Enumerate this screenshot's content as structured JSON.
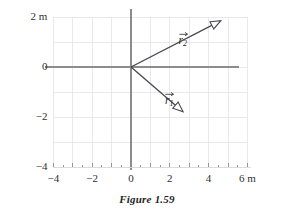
{
  "figure": {
    "caption": "Figure 1.59",
    "units_label_x": "6 m",
    "units_label_y": "2 m"
  },
  "colors": {
    "grid": "#e3e3e8",
    "axis": "#8c8c8c",
    "vector": "#4a4a50",
    "text": "#2f2f2f",
    "background": "#ffffff"
  },
  "axes": {
    "x_ticks": [
      {
        "value": -4,
        "label": "−4"
      },
      {
        "value": -2,
        "label": "−2"
      },
      {
        "value": 0,
        "label": "0"
      },
      {
        "value": 2,
        "label": "2"
      },
      {
        "value": 4,
        "label": "4"
      },
      {
        "value": 6,
        "label": "6 m"
      }
    ],
    "y_ticks": [
      {
        "value": 2,
        "label": "2 m"
      },
      {
        "value": 0,
        "label": "0"
      },
      {
        "value": -2,
        "label": "−2"
      },
      {
        "value": -4,
        "label": "−4"
      }
    ],
    "xlim": [
      -4,
      6
    ],
    "ylim": [
      -4,
      2
    ],
    "grid": true,
    "grid_step": 1
  },
  "vectors": [
    {
      "name": "r1",
      "label_base": "r",
      "label_sub": "1",
      "origin": [
        0,
        0
      ],
      "tip": [
        3,
        -2
      ],
      "label_pos": [
        1.75,
        -1.0
      ]
    },
    {
      "name": "r2",
      "label_base": "r",
      "label_sub": "2",
      "origin": [
        0,
        0
      ],
      "tip": [
        5,
        2
      ],
      "label_pos": [
        2.45,
        1.42
      ]
    }
  ],
  "chart_data": {
    "type": "scatter",
    "title": "Figure 1.59",
    "xlabel": "6 m",
    "ylabel": "2 m",
    "xlim": [
      -4,
      6
    ],
    "ylim": [
      -4,
      2
    ],
    "grid": true,
    "legend": "none",
    "annotations": [
      "r⃗1",
      "r⃗2"
    ],
    "series": [
      {
        "name": "r1",
        "kind": "vector",
        "x": [
          0,
          3
        ],
        "y": [
          0,
          -2
        ],
        "components": {
          "x": 3,
          "y": -2
        },
        "magnitude": 3.61,
        "angle_deg": -33.7
      },
      {
        "name": "r2",
        "kind": "vector",
        "x": [
          0,
          5
        ],
        "y": [
          0,
          2
        ],
        "components": {
          "x": 5,
          "y": 2
        },
        "magnitude": 5.39,
        "angle_deg": 21.8
      }
    ]
  }
}
